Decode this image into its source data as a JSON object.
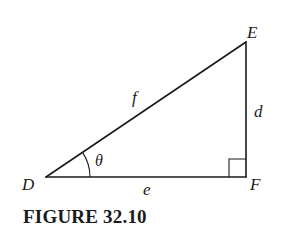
{
  "figure": {
    "caption": "FIGURE 32.10",
    "type": "right-triangle",
    "stroke_color": "#1a1a1a",
    "background": "#ffffff",
    "vertices": {
      "D": {
        "label": "D",
        "x": 46,
        "y": 177
      },
      "E": {
        "label": "E",
        "x": 246,
        "y": 42
      },
      "F": {
        "label": "F",
        "x": 246,
        "y": 177
      }
    },
    "sides": {
      "hypotenuse": {
        "label": "f",
        "from": "D",
        "to": "E"
      },
      "base": {
        "label": "e",
        "from": "D",
        "to": "F"
      },
      "vertical": {
        "label": "d",
        "from": "F",
        "to": "E"
      }
    },
    "angle": {
      "label": "θ",
      "at": "D"
    },
    "right_angle": {
      "at": "F",
      "marker": "square"
    }
  }
}
